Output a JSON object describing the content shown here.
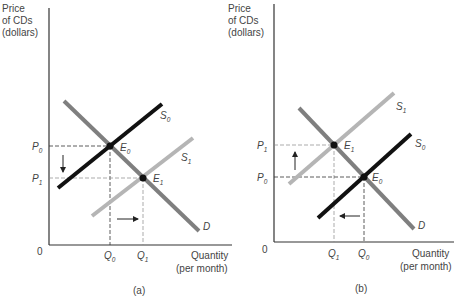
{
  "panels": [
    {
      "id": "a",
      "caption": "(a)",
      "y_axis_label": [
        "Price",
        "of CDs",
        "(dollars)"
      ],
      "x_axis_label": [
        "Quantity",
        "(per month)"
      ],
      "origin_label": "0",
      "price_labels": [
        {
          "base": "P",
          "sub": "0"
        },
        {
          "base": "P",
          "sub": "1"
        }
      ],
      "quantity_labels": [
        {
          "base": "Q",
          "sub": "0"
        },
        {
          "base": "Q",
          "sub": "1"
        }
      ],
      "curves": [
        {
          "name": "D",
          "base": "D",
          "sub": "",
          "color": "#7f7f7f"
        },
        {
          "name": "S0",
          "base": "S",
          "sub": "0",
          "color": "#111111"
        },
        {
          "name": "S1",
          "base": "S",
          "sub": "1",
          "color": "#b5b5b5"
        }
      ],
      "equilibria": [
        {
          "base": "E",
          "sub": "0"
        },
        {
          "base": "E",
          "sub": "1"
        }
      ],
      "arrows": {
        "price": "down",
        "quantity": "right"
      }
    },
    {
      "id": "b",
      "caption": "(b)",
      "y_axis_label": [
        "Price",
        "of CDs",
        "(dollars)"
      ],
      "x_axis_label": [
        "Quantity",
        "(per month)"
      ],
      "origin_label": "0",
      "price_labels": [
        {
          "base": "P",
          "sub": "1"
        },
        {
          "base": "P",
          "sub": "0"
        }
      ],
      "quantity_labels": [
        {
          "base": "Q",
          "sub": "1"
        },
        {
          "base": "Q",
          "sub": "0"
        }
      ],
      "curves": [
        {
          "name": "D",
          "base": "D",
          "sub": "",
          "color": "#7f7f7f"
        },
        {
          "name": "S1",
          "base": "S",
          "sub": "1",
          "color": "#b5b5b5"
        },
        {
          "name": "S0",
          "base": "S",
          "sub": "0",
          "color": "#111111"
        }
      ],
      "equilibria": [
        {
          "base": "E",
          "sub": "1"
        },
        {
          "base": "E",
          "sub": "0"
        }
      ],
      "arrows": {
        "price": "up",
        "quantity": "left"
      }
    }
  ]
}
